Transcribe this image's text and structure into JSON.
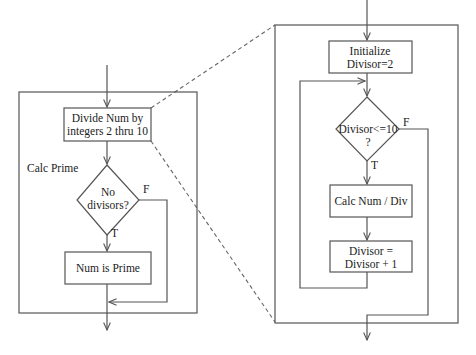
{
  "left_flowchart": {
    "label": "Calc Prime",
    "process_box": {
      "line1": "Divide Num by",
      "line2": "integers 2 thru 10"
    },
    "decision": {
      "line1": "No",
      "line2": "divisors?",
      "true_label": "T",
      "false_label": "F"
    },
    "result_box": {
      "text": "Num is Prime"
    }
  },
  "right_flowchart": {
    "init_box": {
      "line1": "Initialize",
      "line2": "Divisor=2"
    },
    "decision": {
      "line1": "Divisor<=10",
      "line2": "?",
      "true_label": "T",
      "false_label": "F"
    },
    "calc_box": {
      "text": "Calc Num / Div"
    },
    "increment_box": {
      "line1": "Divisor =",
      "line2": "Divisor + 1"
    }
  },
  "colors": {
    "line": "#555555",
    "text": "#222222",
    "background": "#ffffff"
  }
}
